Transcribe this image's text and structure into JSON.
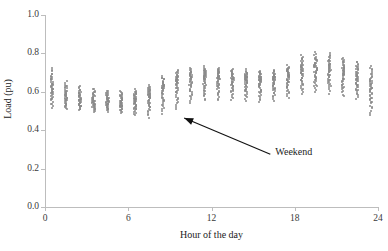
{
  "chart_data": {
    "type": "scatter",
    "title": "",
    "xlabel": "Hour of the day",
    "ylabel": "Load (pu)",
    "xlim": [
      0,
      24
    ],
    "ylim": [
      0.0,
      1.0
    ],
    "xticks": [
      0,
      6,
      12,
      18,
      24
    ],
    "xticklabels": [
      "0",
      "6",
      "12",
      "18",
      "24"
    ],
    "yticks": [
      0.0,
      0.2,
      0.4,
      0.6,
      0.8,
      1.0
    ],
    "yticklabels": [
      "0.0",
      "0.2",
      "0.4",
      "0.6",
      "0.8",
      "1.0"
    ],
    "grid": false,
    "legend": null,
    "marker": "dot",
    "marker_color": "#8a8a8a",
    "series": [
      {
        "name": "Daily load profiles",
        "description": "Hourly load values (per unit) for many days, one vertical cluster per hour",
        "points_by_hour": [
          {
            "hour": 0,
            "min": 0.505,
            "max": 0.735,
            "median": 0.62,
            "count": 44
          },
          {
            "hour": 1,
            "min": 0.5,
            "max": 0.66,
            "median": 0.575,
            "count": 42
          },
          {
            "hour": 2,
            "min": 0.495,
            "max": 0.64,
            "median": 0.56,
            "count": 42
          },
          {
            "hour": 3,
            "min": 0.49,
            "max": 0.625,
            "median": 0.55,
            "count": 42
          },
          {
            "hour": 4,
            "min": 0.49,
            "max": 0.615,
            "median": 0.548,
            "count": 42
          },
          {
            "hour": 5,
            "min": 0.485,
            "max": 0.61,
            "median": 0.545,
            "count": 42
          },
          {
            "hour": 6,
            "min": 0.47,
            "max": 0.62,
            "median": 0.552,
            "count": 42
          },
          {
            "hour": 7,
            "min": 0.455,
            "max": 0.64,
            "median": 0.575,
            "count": 43
          },
          {
            "hour": 8,
            "min": 0.47,
            "max": 0.69,
            "median": 0.615,
            "count": 44
          },
          {
            "hour": 9,
            "min": 0.49,
            "max": 0.72,
            "median": 0.648,
            "count": 45
          },
          {
            "hour": 10,
            "min": 0.53,
            "max": 0.73,
            "median": 0.665,
            "count": 45
          },
          {
            "hour": 11,
            "min": 0.54,
            "max": 0.735,
            "median": 0.672,
            "count": 45
          },
          {
            "hour": 12,
            "min": 0.545,
            "max": 0.73,
            "median": 0.668,
            "count": 45
          },
          {
            "hour": 13,
            "min": 0.545,
            "max": 0.725,
            "median": 0.665,
            "count": 45
          },
          {
            "hour": 14,
            "min": 0.54,
            "max": 0.72,
            "median": 0.66,
            "count": 45
          },
          {
            "hour": 15,
            "min": 0.535,
            "max": 0.715,
            "median": 0.655,
            "count": 45
          },
          {
            "hour": 16,
            "min": 0.54,
            "max": 0.72,
            "median": 0.66,
            "count": 45
          },
          {
            "hour": 17,
            "min": 0.555,
            "max": 0.745,
            "median": 0.678,
            "count": 45
          },
          {
            "hour": 18,
            "min": 0.575,
            "max": 0.8,
            "median": 0.705,
            "count": 46
          },
          {
            "hour": 19,
            "min": 0.585,
            "max": 0.815,
            "median": 0.718,
            "count": 46
          },
          {
            "hour": 20,
            "min": 0.58,
            "max": 0.81,
            "median": 0.712,
            "count": 46
          },
          {
            "hour": 21,
            "min": 0.565,
            "max": 0.79,
            "median": 0.695,
            "count": 46
          },
          {
            "hour": 22,
            "min": 0.55,
            "max": 0.77,
            "median": 0.672,
            "count": 45
          },
          {
            "hour": 23,
            "min": 0.465,
            "max": 0.75,
            "median": 0.62,
            "count": 45
          }
        ]
      }
    ],
    "annotations": [
      {
        "name": "weekend",
        "text": "Weekend",
        "text_x": 16.6,
        "text_y": 0.285,
        "arrow_tip_x": 9.6,
        "arrow_tip_y": 0.495
      }
    ]
  }
}
